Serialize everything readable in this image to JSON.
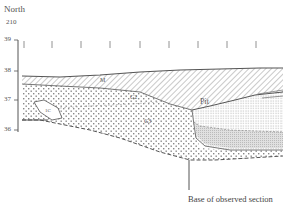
{
  "header": {
    "direction": "North",
    "grid_ref": "210"
  },
  "axis": {
    "ticks": [
      {
        "label": "39",
        "y": 40
      },
      {
        "label": "38",
        "y": 71
      },
      {
        "label": "37",
        "y": 100
      },
      {
        "label": "36",
        "y": 130
      }
    ],
    "unit_markers_x": [
      24,
      52,
      81,
      110,
      140,
      169,
      198,
      227,
      256
    ]
  },
  "layers": [
    {
      "id": "M",
      "label": "M",
      "pattern": "diagonal-hatch"
    },
    {
      "id": "G2",
      "label": "G2",
      "pattern": "coarse-dots"
    },
    {
      "id": "G3",
      "label": "G3",
      "pattern": "coarse-dots"
    },
    {
      "id": "1C",
      "label": "1C",
      "pattern": "lens-outline"
    },
    {
      "id": "Pit",
      "label": "Pit",
      "pattern": "fine-dots"
    }
  ],
  "annotation": {
    "base_label": "Base of observed section"
  },
  "colors": {
    "line": "#555555",
    "hatch": "#777777",
    "dot": "#888888",
    "fine_fill": "#cfcfcf"
  }
}
